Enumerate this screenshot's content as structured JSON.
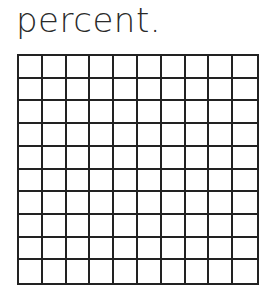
{
  "caption": "percent.",
  "hundred_grid": {
    "rows": 10,
    "columns": 10,
    "shaded_cells": 0,
    "line_color": "#222222",
    "fill_color": "#ffffff"
  }
}
